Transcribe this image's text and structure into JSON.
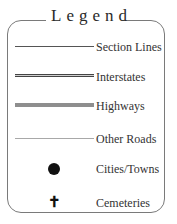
{
  "legend": {
    "title": "Legend",
    "items": [
      {
        "label": "Section Lines",
        "symbol": "thin-dark-line"
      },
      {
        "label": "Interstates",
        "symbol": "double-line"
      },
      {
        "label": "Highways",
        "symbol": "thick-gray-line"
      },
      {
        "label": "Other Roads",
        "symbol": "thin-light-line"
      },
      {
        "label": "Cities/Towns",
        "symbol": "filled-circle"
      },
      {
        "label": "Cemeteries",
        "symbol": "cross",
        "glyph": "✝"
      }
    ]
  },
  "colors": {
    "border": "#7a7a7a",
    "section_line": "#555555",
    "interstate": "#444444",
    "highway": "#8e8e8e",
    "other_road": "#a8a8a8",
    "city": "#111111"
  }
}
